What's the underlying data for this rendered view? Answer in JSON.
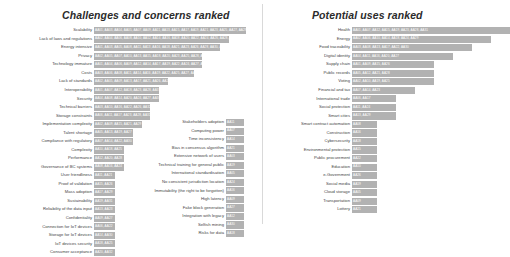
{
  "panels": {
    "left": {
      "title": "Challenges and concerns ranked"
    },
    "right": {
      "title": "Potential uses ranked"
    }
  },
  "colors": {
    "bar_fill": "#b2b2b2",
    "bar_code_text": "#ffffff",
    "label_text": "#444444",
    "title_text": "#2b2b2b",
    "divider": "#d9d9d9",
    "background": "#ffffff"
  },
  "chart_data": [
    {
      "type": "bar",
      "title": "Challenges and concerns ranked",
      "orientation": "horizontal",
      "xlabel": "",
      "ylabel": "",
      "grid": false,
      "legend": "none",
      "value_unit": "number of respondent codes",
      "note": "Each bar is a stacked count of respondent codes (AA01..AA32) printed inside the bar.",
      "categories": [
        "Scalability",
        "Lack of laws and regulations",
        "Energy intensive",
        "Privacy",
        "Technology immature",
        "Costs",
        "Lack of standards",
        "Interoperability",
        "Security",
        "Technical barriers",
        "Storage constraints",
        "Implementation complexity",
        "Talent shortage",
        "Compliance with regulatory",
        "Complexity",
        "Performance",
        "Governance of BC systems",
        "User friendliness",
        "Proof of validation",
        "Mass adoption",
        "Sustainability",
        "Reliability of the data input",
        "Confidentiality",
        "Connection for IoT devices",
        "Storage for IoT devices",
        "IoT devices security",
        "Consumer acceptance"
      ],
      "values": [
        17,
        15,
        14,
        12,
        12,
        11,
        8,
        7,
        7,
        6,
        6,
        5,
        4,
        4,
        3,
        3,
        3,
        2,
        2,
        2,
        2,
        2,
        2,
        2,
        2,
        2,
        2
      ],
      "codes": [
        "AA01, AA03, AA04, AA05, AA07, AA09, AA11, AA13, AA15, AA17, AA19, AA21, AA23, AA25, AA27, AA29, AA31",
        "AA02, AA04, AA06, AA08, AA10, AA12, AA14, AA16, AA18, AA20, AA22, AA24, AA26, AA28, AA30",
        "AA01, AA03, AA05, AA08, AA11, AA13, AA16, AA18, AA21, AA23, AA26, AA28, AA30, AA32",
        "AA02, AA05, AA07, AA10, AA13, AA15, AA18, AA20, AA23, AA25, AA28, AA31",
        "AA01, AA04, AA06, AA09, AA12, AA14, AA17, AA19, AA22, AA24, AA27, AA29",
        "AA03, AA06, AA08, AA11, AA14, AA16, AA19, AA22, AA25, AA27, AA30",
        "AA02, AA05, AA09, AA13, AA17, AA21, AA26, AA29",
        "AA01, AA07, AA12, AA18, AA23, AA28, AA31",
        "AA04, AA08, AA14, AA20, AA24, AA27, AA30",
        "AA03, AA10, AA16, AA22, AA26, AA32",
        "AA06, AA11, AA17, AA23, AA28, AA31",
        "AA02, AA09, AA15, AA21, AA29",
        "AA05, AA13, AA19, AA27",
        "AA07, AA14, AA22, AA30",
        "AA10, AA18, AA25",
        "AA12, AA20, AA28",
        "AA08, AA16, AA24",
        "AA11, AA21",
        "AA15, AA26",
        "AA17, AA29",
        "AA19, AA31",
        "AA13, AA23",
        "AA09, AA27",
        "AA06, AA22",
        "AA14, AA30",
        "AA18, AA25",
        "AA20, AA32"
      ]
    },
    {
      "type": "bar",
      "title": "Challenges and concerns ranked (continued)",
      "orientation": "horizontal",
      "xlabel": "",
      "ylabel": "",
      "grid": false,
      "legend": "none",
      "note": "Second sub-column of the left panel; every item has a single respondent code.",
      "categories": [
        "Stakeholders adoption",
        "Computing power",
        "Time inconsistency",
        "Bias in consensus algorithm",
        "Extensive network of users",
        "Technical training for general public",
        "International standardisation",
        "No consistent jurisdiction location",
        "Immutability (the right to be forgotten)",
        "High latency",
        "Fake block generation",
        "Integration with legacy",
        "Selfish mining",
        "Risks for data"
      ],
      "values": [
        1,
        1,
        1,
        1,
        1,
        1,
        1,
        1,
        1,
        1,
        1,
        1,
        1,
        1
      ],
      "codes": [
        "AA11",
        "AA07",
        "AA14",
        "AA21",
        "AA03",
        "AA19",
        "AA05",
        "AA24",
        "AA16",
        "AA09",
        "AA27",
        "AA12",
        "AA30",
        "AA18"
      ]
    },
    {
      "type": "bar",
      "title": "Potential uses ranked",
      "orientation": "horizontal",
      "xlabel": "",
      "ylabel": "",
      "grid": false,
      "legend": "none",
      "value_unit": "number of respondent codes",
      "note": "Each bar is a stacked count of respondent codes (AA01..AA32) printed inside the bar.",
      "categories": [
        "Health",
        "Energy",
        "Food traceability",
        "Digital identity",
        "Supply chain",
        "Public records",
        "Voting",
        "Financial and tax",
        "International trade",
        "Social protection",
        "Smart cities",
        "Smart contract automation",
        "Construction",
        "Cybersecurity",
        "Environmental protection",
        "Public procurement",
        "Education",
        "e-Government",
        "Social media",
        "Cloud storage",
        "Transportation",
        "Lottery"
      ],
      "values": [
        8,
        7,
        6,
        5,
        4,
        4,
        4,
        3,
        2,
        2,
        2,
        1,
        1,
        1,
        1,
        1,
        1,
        1,
        1,
        1,
        1,
        1
      ],
      "codes": [
        "AA01, AA07, AA12, AA15, AA19, AA23, AA28, AA31",
        "AA02, AA06, AA10, AA14, AA18, AA24, AA29",
        "AA03, AA08, AA13, AA17, AA22, AA30",
        "AA04, AA11, AA16, AA20, AA27",
        "AA01, AA09, AA15, AA26",
        "AA05, AA12, AA21, AA28",
        "AA02, AA10, AA19, AA25",
        "AA07, AA14, AA23",
        "AA06, AA17",
        "AA11, AA24",
        "AA13, AA29",
        "AA08",
        "AA16",
        "AA18",
        "AA15",
        "AA22",
        "AA10",
        "AA26",
        "AA19",
        "AA05",
        "AA09",
        "AA21"
      ]
    }
  ]
}
